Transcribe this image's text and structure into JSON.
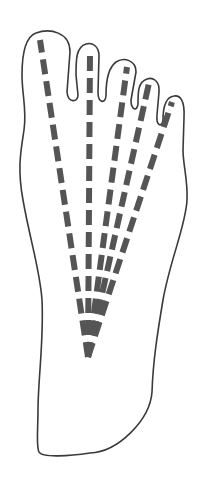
{
  "diagram": {
    "colors": {
      "background": "#ffffff",
      "outline": "#3a3a3a",
      "dashes": "#555555"
    },
    "origin": {
      "x": 88,
      "y": 357
    },
    "rays": [
      {
        "name": "toe-1",
        "x2": 40,
        "y2": 40
      },
      {
        "name": "toe-2",
        "x2": 90,
        "y2": 52
      },
      {
        "name": "toe-3",
        "x2": 127,
        "y2": 67
      },
      {
        "name": "toe-4",
        "x2": 149,
        "y2": 83
      },
      {
        "name": "toe-5",
        "x2": 172,
        "y2": 102
      }
    ]
  }
}
